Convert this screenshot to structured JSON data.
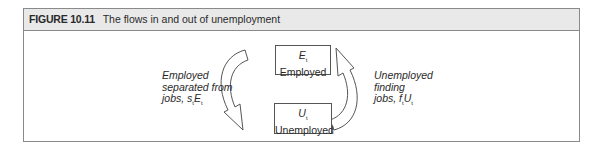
{
  "figure": {
    "number": "FIGURE 10.11",
    "title": "The flows in and out of unemployment"
  },
  "diagram": {
    "employed_box": {
      "symbol": "E",
      "subscript": "t",
      "label": "Employed"
    },
    "unemployed_box": {
      "symbol": "U",
      "subscript": "t",
      "label": "Unemployed"
    },
    "left_flow": {
      "line1": "Employed",
      "line2": "separated from",
      "line3_prefix": "jobs, ",
      "rate_symbol": "s",
      "rate_subscript": "t",
      "stock_symbol": "E",
      "stock_subscript": "t"
    },
    "right_flow": {
      "line1": "Unemployed",
      "line2": "finding",
      "line3_prefix": "jobs, ",
      "rate_symbol": "f",
      "rate_subscript": "t",
      "stock_symbol": "U",
      "stock_subscript": "t"
    }
  },
  "colors": {
    "header_bg": "#e9e9e9",
    "border": "#8a8a8a",
    "text": "#2a2a2a"
  }
}
